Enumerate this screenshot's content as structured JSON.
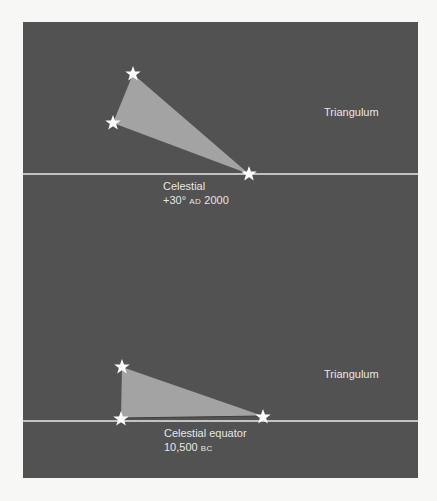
{
  "colors": {
    "page_background": "#f7f7f5",
    "panel_background": "#525252",
    "triangle_fill": "#a3a3a3",
    "line_color": "#e8e8e8",
    "star_color": "#ffffff",
    "text_color": "#e6e6e6"
  },
  "top_panel": {
    "constellation_label": "Triangulum",
    "line_label_line1": "Celestial",
    "line_label_line2_prefix": "+30°",
    "line_label_era": "AD",
    "line_label_year": "2000",
    "stars": [
      {
        "x": 133,
        "y": 74
      },
      {
        "x": 113,
        "y": 123
      },
      {
        "x": 249,
        "y": 174
      }
    ],
    "line_y": 174
  },
  "bottom_panel": {
    "constellation_label": "Triangulum",
    "line_label_line1": "Celestial equator",
    "line_label_year": "10,500",
    "line_label_era": "BC",
    "stars": [
      {
        "x": 122,
        "y": 367
      },
      {
        "x": 121,
        "y": 419
      },
      {
        "x": 263,
        "y": 417
      }
    ],
    "line_y": 421
  },
  "icons": {
    "star": "star-icon"
  }
}
